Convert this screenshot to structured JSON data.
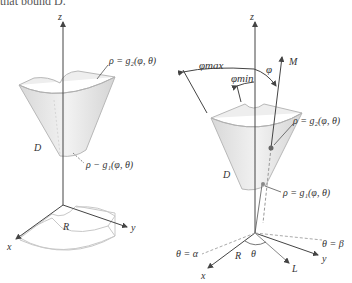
{
  "caption_fragment": "that bound D.",
  "left_figure": {
    "axes": {
      "z": "z",
      "x": "x",
      "y": "y"
    },
    "labels": {
      "outer_surface": "ρ = g₂(φ, θ)",
      "inner_surface": "ρ − g₁(φ, θ)",
      "solid": "D",
      "region": "R"
    }
  },
  "right_figure": {
    "axes": {
      "z": "z",
      "x": "x",
      "y": "y"
    },
    "labels": {
      "phi_max": "φmax",
      "phi_min": "φmin",
      "phi": "φ",
      "ray_M": "M",
      "outer_surface": "ρ = g₂(φ, θ)",
      "inner_surface": "ρ = g₁(φ, θ)",
      "solid": "D",
      "region": "R",
      "theta": "θ",
      "ray_L": "L",
      "theta_alpha": "θ = α",
      "theta_beta": "θ = β"
    }
  },
  "colors": {
    "solid_fill": "#e4e4e4",
    "solid_edge": "#b8b8b8",
    "axis": "#444444",
    "dashed": "#aaaaaa",
    "point": "#666666"
  }
}
